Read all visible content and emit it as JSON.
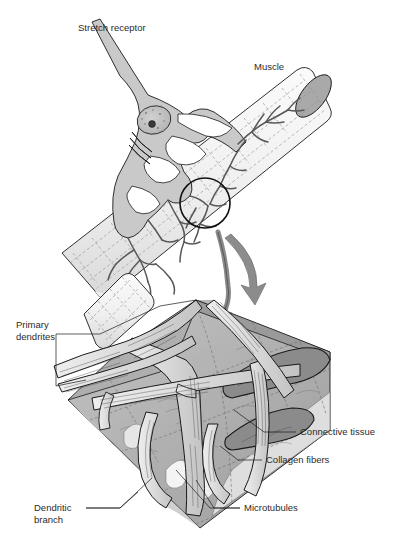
{
  "figure": {
    "background_color": "#ffffff",
    "text_color": "#2b2b2b",
    "panels": [
      {
        "id": "overview",
        "name": "stretch-receptor-overview"
      },
      {
        "id": "detail",
        "name": "dendrite-magnified-detail"
      }
    ]
  },
  "upper_panel": {
    "labels": {
      "stretch_receptor": "Stretch receptor",
      "muscle": "Muscle"
    },
    "callout": {
      "name": "magnification-circle",
      "cx": 205,
      "cy": 203,
      "r": 25
    },
    "arrow": {
      "name": "magnify-arrow",
      "color": "#8c8c8c"
    }
  },
  "lower_panel": {
    "labels": {
      "primary_dendrites_line1": "Primary",
      "primary_dendrites_line2": "dendrites",
      "connective_tissue": "Connective tissue",
      "collagen_fibers": "Collagen  fibers",
      "dendritic_branch_line1": "Dendritic",
      "dendritic_branch_line2": "branch",
      "microtubules": "Microtubules"
    }
  },
  "colors": {
    "line": "#1a1a1a",
    "cell_body_fill": "#c9c9c9",
    "muscle_fill": "#f2f2f2",
    "muscle_end_fill": "#a9a9a9",
    "slab_top": "#b9b9b9",
    "slab_mid": "#8f8f8f",
    "slab_light": "#d8d8d8",
    "slab_pale": "#e8e8e8",
    "dendrite_fill": "#dcdcdc",
    "arrow": "#8c8c8c",
    "dashed_guide": "#8e8e8e"
  }
}
